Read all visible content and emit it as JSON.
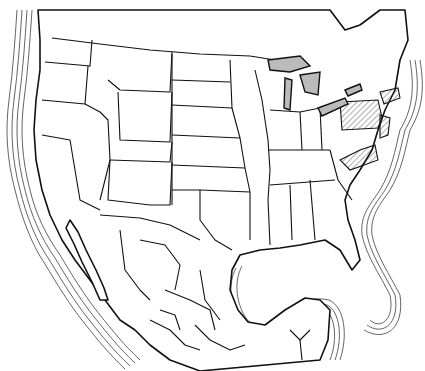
{
  "map": {
    "title": "",
    "region": "North America (United States, Mexico, southern Canada)",
    "style": "black-and-white line map with coastal contour rings",
    "colors": {
      "land": "#ffffff",
      "lines": "#111111",
      "lakes": "#bbbbbb",
      "background": "#ffffff"
    },
    "highlighted_regions": [
      "Pennsylvania",
      "New Jersey",
      "Delaware",
      "Connecticut",
      "Rhode Island",
      "Virginia"
    ],
    "highlight_pattern": "diagonal-hatch",
    "labels": []
  }
}
